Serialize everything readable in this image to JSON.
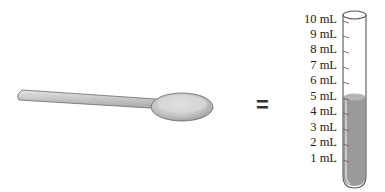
{
  "diagram": {
    "left_item": "teaspoon",
    "operator": "=",
    "right_item": "test tube",
    "tube": {
      "scale_labels": [
        "10 mL",
        "9 mL",
        "8 mL",
        "7 mL",
        "6 mL",
        "5 mL",
        "4 mL",
        "3 mL",
        "2 mL",
        "1 mL"
      ],
      "fill_level_ml": 5,
      "liquid_color": "#9a9a9a"
    },
    "colors": {
      "spoon": "#c8c8c8",
      "outline": "#555555"
    }
  }
}
